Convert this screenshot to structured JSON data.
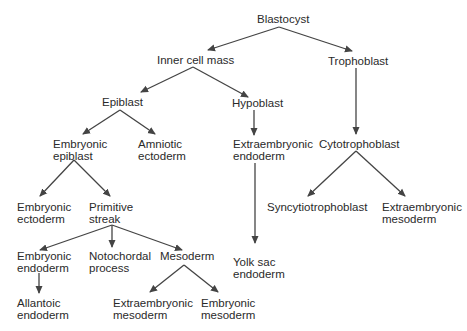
{
  "diagram": {
    "type": "tree",
    "title": "",
    "nodes": {
      "blastocyst": {
        "lines": [
          "Blastocyst"
        ]
      },
      "inner_cell_mass": {
        "lines": [
          "Inner cell mass"
        ]
      },
      "trophoblast": {
        "lines": [
          "Trophoblast"
        ]
      },
      "epiblast": {
        "lines": [
          "Epiblast"
        ]
      },
      "hypoblast": {
        "lines": [
          "Hypoblast"
        ]
      },
      "cytotrophoblast": {
        "lines": [
          "Cytotrophoblast"
        ]
      },
      "embryonic_epiblast": {
        "lines": [
          "Embryonic",
          "epiblast"
        ]
      },
      "amniotic_ectoderm": {
        "lines": [
          "Amniotic",
          "ectoderm"
        ]
      },
      "extraembryonic_endoderm": {
        "lines": [
          "Extraembryonic",
          "endoderm"
        ]
      },
      "syncytiotrophoblast": {
        "lines": [
          "Syncytiotrophoblast"
        ]
      },
      "extraembryonic_mesoderm_troph": {
        "lines": [
          "Extraembryonic",
          "mesoderm"
        ]
      },
      "embryonic_ectoderm": {
        "lines": [
          "Embryonic",
          "ectoderm"
        ]
      },
      "primitive_streak": {
        "lines": [
          "Primitive",
          "streak"
        ]
      },
      "yolk_sac_endoderm": {
        "lines": [
          "Yolk sac",
          "endoderm"
        ]
      },
      "embryonic_endoderm": {
        "lines": [
          "Embryonic",
          "endoderm"
        ]
      },
      "notochordal_process": {
        "lines": [
          "Notochordal",
          "process"
        ]
      },
      "mesoderm": {
        "lines": [
          "Mesoderm"
        ]
      },
      "allantoic_endoderm": {
        "lines": [
          "Allantoic",
          "endoderm"
        ]
      },
      "extraembryonic_mesoderm": {
        "lines": [
          "Extraembryonic",
          "mesoderm"
        ]
      },
      "embryonic_mesoderm": {
        "lines": [
          "Embryonic",
          "mesoderm"
        ]
      }
    },
    "edges": [
      [
        "Blastocyst",
        "Inner cell mass"
      ],
      [
        "Blastocyst",
        "Trophoblast"
      ],
      [
        "Inner cell mass",
        "Epiblast"
      ],
      [
        "Inner cell mass",
        "Hypoblast"
      ],
      [
        "Trophoblast",
        "Cytotrophoblast"
      ],
      [
        "Epiblast",
        "Embryonic epiblast"
      ],
      [
        "Epiblast",
        "Amniotic ectoderm"
      ],
      [
        "Hypoblast",
        "Extraembryonic endoderm"
      ],
      [
        "Extraembryonic endoderm",
        "Yolk sac endoderm"
      ],
      [
        "Cytotrophoblast",
        "Syncytiotrophoblast"
      ],
      [
        "Cytotrophoblast",
        "Extraembryonic mesoderm"
      ],
      [
        "Embryonic epiblast",
        "Embryonic ectoderm"
      ],
      [
        "Embryonic epiblast",
        "Primitive streak"
      ],
      [
        "Primitive streak",
        "Embryonic endoderm"
      ],
      [
        "Primitive streak",
        "Notochordal process"
      ],
      [
        "Primitive streak",
        "Mesoderm"
      ],
      [
        "Embryonic endoderm",
        "Allantoic endoderm"
      ],
      [
        "Mesoderm",
        "Extraembryonic mesoderm"
      ],
      [
        "Mesoderm",
        "Embryonic mesoderm"
      ]
    ],
    "colors": {
      "text": "#2a2a2a",
      "edge": "#444444",
      "background": "#ffffff"
    }
  }
}
